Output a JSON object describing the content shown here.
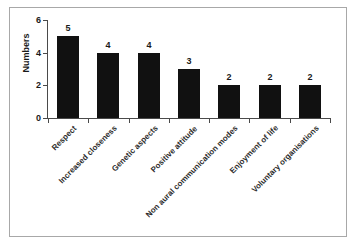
{
  "chart_data": {
    "type": "bar",
    "title": "",
    "xlabel": "",
    "ylabel": "Numbers",
    "ylim": [
      0,
      6
    ],
    "yticks": [
      0,
      2,
      4,
      6
    ],
    "grid": false,
    "legend": false,
    "orientation": "vertical",
    "bar_color": "#111111",
    "categories": [
      "Respect",
      "Increased closeness",
      "Genetic aspects",
      "Positive attitude",
      "Non aural communication modes",
      "Enjoyment of life",
      "Voluntary organisations"
    ],
    "values": [
      5,
      4,
      4,
      3,
      2,
      2,
      2
    ],
    "data_labels": [
      "5",
      "4",
      "4",
      "3",
      "2",
      "2",
      "2"
    ],
    "ytick_labels": [
      "0",
      "2",
      "4",
      "6"
    ]
  },
  "figure": {
    "frame_color": "#a8a8a8",
    "axis_color": "#4a4a4a",
    "text_color": "#1a1a1a",
    "background": "#ffffff"
  }
}
